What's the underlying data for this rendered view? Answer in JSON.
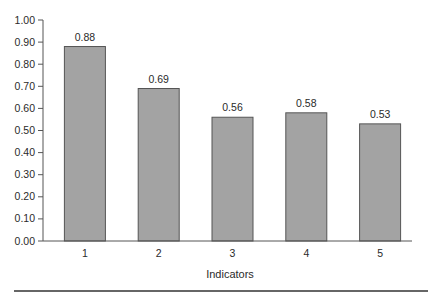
{
  "chart_data": {
    "type": "bar",
    "title": "",
    "xlabel": "Indicators",
    "ylabel": "",
    "categories": [
      "1",
      "2",
      "3",
      "4",
      "5"
    ],
    "values": [
      0.88,
      0.69,
      0.56,
      0.58,
      0.53
    ],
    "data_labels": [
      "0.88",
      "0.69",
      "0.56",
      "0.58",
      "0.53"
    ],
    "ylim": [
      0,
      1.0
    ],
    "yticks": [
      "0.00",
      "0.10",
      "0.20",
      "0.30",
      "0.40",
      "0.50",
      "0.60",
      "0.70",
      "0.80",
      "0.90",
      "1.00"
    ],
    "grid": false,
    "legend": null,
    "colors": {
      "bar_fill": "#a3a3a3",
      "bar_stroke": "#555555",
      "axis": "#555555",
      "rule": "#333333"
    }
  }
}
